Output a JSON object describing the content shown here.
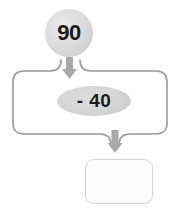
{
  "diagram": {
    "type": "function-machine",
    "title": "",
    "nodes": {
      "input": {
        "label": "90",
        "shape": "circle",
        "fill": "#d6d6d6",
        "text_color": "#1b1b1b"
      },
      "operation": {
        "label": "- 40",
        "shape": "ellipse",
        "fill": "#d0d0d0",
        "text_color": "#1c1c1c"
      },
      "output": {
        "label": "",
        "shape": "rounded-rectangle",
        "fill": "#fdfdfd",
        "border_color": "#d3d3d3",
        "text_color": "#1c1c1c"
      }
    },
    "arrows": {
      "input_to_operation": {
        "direction": "down",
        "color": "#a9a9a9"
      },
      "operation_to_output": {
        "direction": "down",
        "color": "#a9a9a9"
      }
    },
    "frame": {
      "shape": "bracket-frame",
      "color": "#9a9a9a"
    }
  }
}
